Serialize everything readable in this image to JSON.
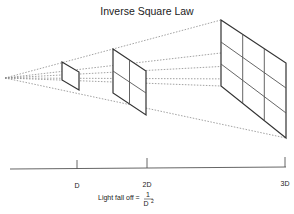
{
  "title": "Inverse Square Law",
  "axis": {
    "ticks": [
      {
        "label": "D"
      },
      {
        "label": "2D"
      },
      {
        "label": "3D"
      }
    ]
  },
  "formula": {
    "prefix": "Light fall off =",
    "numerator": "1",
    "denominator": "D",
    "exponent": "2"
  },
  "colors": {
    "frame": "#333333",
    "grid": "#666666",
    "rays": "#888888",
    "axis": "#555555"
  }
}
